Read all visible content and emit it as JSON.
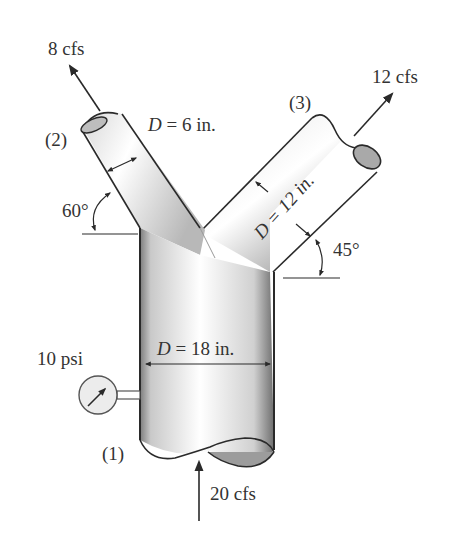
{
  "diagram": {
    "type": "pipe-wye-junction",
    "colors": {
      "stroke": "#2a2a2a",
      "text": "#333333",
      "pipe_light": "#ffffff",
      "pipe_dark": "#8a8a8a"
    },
    "sections": [
      {
        "id": "1",
        "label": "(1)",
        "diameter_label": "D = 18 in.",
        "flow_label": "20 cfs",
        "pressure_label": "10 psi"
      },
      {
        "id": "2",
        "label": "(2)",
        "diameter_label": "D = 6 in.",
        "flow_label": "8 cfs",
        "angle_label": "60°"
      },
      {
        "id": "3",
        "label": "(3)",
        "diameter_label": "D = 12 in.",
        "flow_label": "12 cfs",
        "angle_label": "45°"
      }
    ],
    "text": {
      "d_symbol": "D",
      "d6": " = 6 in.",
      "d12": "D = 12 in.",
      "d18": " = 18 in."
    }
  }
}
